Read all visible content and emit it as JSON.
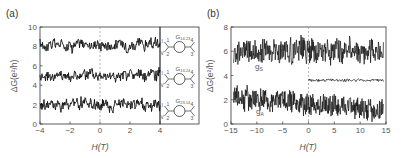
{
  "chart_data": [
    {
      "panel_label": "(a)",
      "type": "line",
      "xlabel": "H(T)",
      "ylabel": "ΔG(e²/h)",
      "xlim": [
        -4,
        4
      ],
      "ylim": [
        0,
        10
      ],
      "xticks": [
        "-4",
        "-2",
        "0",
        "2",
        "4"
      ],
      "xtick_values": [
        -4,
        -2,
        0,
        2,
        4
      ],
      "yticks": [
        "0",
        "2",
        "4",
        "6",
        "8",
        "10"
      ],
      "ytick_values": [
        0,
        2,
        4,
        6,
        8,
        10
      ],
      "grid": false,
      "series": [
        {
          "name": "G14,23",
          "baseline": 8.2,
          "fluctuation_amplitude": 1.2,
          "x_range": [
            -4,
            4
          ]
        },
        {
          "name": "G13,24",
          "baseline": 5.0,
          "fluctuation_amplitude": 1.2,
          "x_range": [
            -4,
            4
          ]
        },
        {
          "name": "G23,14",
          "baseline": 2.0,
          "fluctuation_amplitude": 1.2,
          "x_range": [
            -4,
            4
          ]
        }
      ],
      "insets": [
        {
          "label": "G",
          "subscript": "14,23",
          "contacts": [
            "1",
            "2",
            "3",
            "4"
          ]
        },
        {
          "label": "G",
          "subscript": "13,24",
          "contacts": [
            "1",
            "2",
            "3",
            "4"
          ]
        },
        {
          "label": "G",
          "subscript": "23,14",
          "contacts": [
            "1",
            "2",
            "3",
            "4"
          ]
        }
      ],
      "annotations": [
        "dashed vertical line at H = 0"
      ]
    },
    {
      "panel_label": "(b)",
      "type": "line",
      "xlabel": "H(T)",
      "ylabel": "ΔG(e²/h)",
      "xlim": [
        -15,
        15
      ],
      "ylim": [
        0,
        8
      ],
      "xticks": [
        "-15",
        "-10",
        "-5",
        "0",
        "5",
        "10",
        "15"
      ],
      "xtick_values": [
        -15,
        -10,
        -5,
        0,
        5,
        10,
        15
      ],
      "yticks": [
        "0",
        "2",
        "4",
        "6",
        "8"
      ],
      "ytick_values": [
        0,
        2,
        4,
        6,
        8
      ],
      "grid": false,
      "series": [
        {
          "name": "gS",
          "label": "g",
          "label_sub": "S",
          "baseline": 6.0,
          "fluctuation_amplitude": 1.0,
          "x_range": [
            -14.5,
            14.5
          ]
        },
        {
          "name": "gA",
          "label": "g",
          "label_sub": "A",
          "baseline_start": 2.2,
          "baseline_end": 1.1,
          "fluctuation_amplitude": 0.9,
          "x_range": [
            -14.5,
            14.5
          ]
        },
        {
          "name": "antisymmetric residual",
          "baseline": 3.6,
          "fluctuation_amplitude": 0.1,
          "x_range": [
            0,
            14.5
          ]
        }
      ],
      "annotations": [
        "dashed vertical line at H = 0"
      ]
    }
  ]
}
